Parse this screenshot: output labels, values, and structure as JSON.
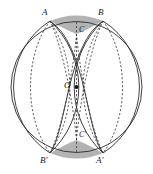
{
  "figure": {
    "type": "geometry-diagram",
    "width": 153,
    "height": 174,
    "colors": {
      "stroke": "#2b2b2b",
      "dashed_stroke": "#3a3a3a",
      "shade_fill": "#b3b3b3",
      "background": "#ffffff",
      "label": "#1a1a1a"
    },
    "main_circle": {
      "cx": 76.5,
      "cy": 87,
      "r": 65.5
    },
    "center_point": {
      "x": 76.5,
      "y": 87,
      "label": "O"
    },
    "labels": [
      {
        "name": "point-a",
        "text": "A",
        "x": 42,
        "y": 8
      },
      {
        "name": "point-b",
        "text": "B",
        "x": 98,
        "y": 8
      },
      {
        "name": "point-c",
        "text": "C",
        "x": 79,
        "y": 26
      },
      {
        "name": "point-o",
        "text": "O",
        "x": 64,
        "y": 81
      },
      {
        "name": "point-c-prime",
        "text": "C'",
        "x": 79,
        "y": 131
      },
      {
        "name": "point-b-prime",
        "text": "B'",
        "x": 40,
        "y": 156
      },
      {
        "name": "point-a-prime",
        "text": "A'",
        "x": 96,
        "y": 156
      }
    ],
    "points": {
      "A": {
        "x": 50,
        "y": 21
      },
      "B": {
        "x": 103,
        "y": 21
      },
      "C": {
        "x": 76.5,
        "y": 34
      },
      "O": {
        "x": 76.5,
        "y": 87
      },
      "Cp": {
        "x": 76.5,
        "y": 140
      },
      "Bp": {
        "x": 50,
        "y": 153
      },
      "Ap": {
        "x": 103,
        "y": 153
      }
    },
    "shaded_regions": [
      {
        "name": "top-shaded-triangle",
        "vertices": [
          "A",
          "B",
          "C"
        ]
      },
      {
        "name": "bottom-shaded-triangle",
        "vertices": [
          "B'",
          "A'",
          "C'"
        ]
      }
    ]
  }
}
